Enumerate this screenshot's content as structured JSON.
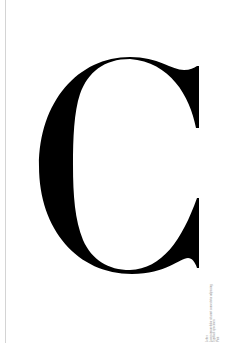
{
  "page": {
    "background": "#ffffff",
    "edge_line_color": "#d4d4d4"
  },
  "glyph": {
    "character": "C",
    "color": "#000000",
    "style": "didone-serif-capital"
  },
  "caption": {
    "lines": [
      "Letter",
      "Lorem ipsum dolor sit amet consectetur adipiscing",
      "Typeface specimen",
      "Print"
    ],
    "color": "#8a8a8a",
    "orientation": "vertical"
  }
}
